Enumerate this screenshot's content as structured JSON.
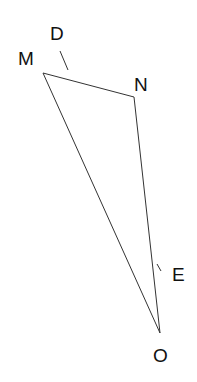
{
  "diagram": {
    "type": "triangle",
    "points": {
      "M": {
        "label": "M",
        "x": 43,
        "y": 73
      },
      "N": {
        "label": "N",
        "x": 134,
        "y": 97
      },
      "O": {
        "label": "O",
        "x": 160,
        "y": 333
      }
    },
    "edges": [
      [
        "M",
        "N"
      ],
      [
        "N",
        "O"
      ],
      [
        "M",
        "O"
      ]
    ],
    "ticks": {
      "D": {
        "label": "D"
      },
      "E": {
        "label": "E"
      }
    },
    "stroke_color": "#333333"
  }
}
